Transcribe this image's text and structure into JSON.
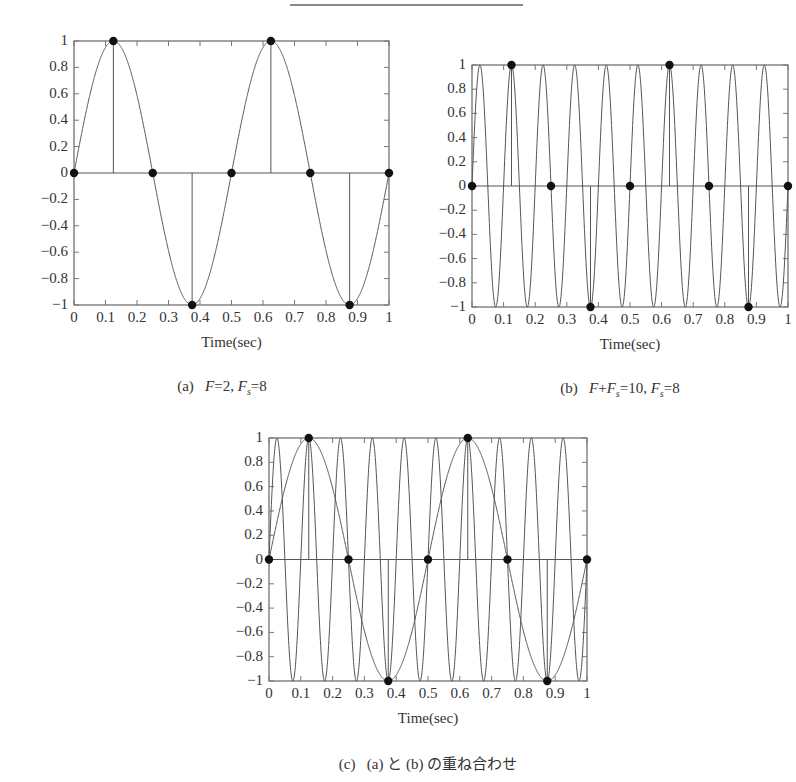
{
  "header": {
    "rule": true
  },
  "chart_data": [
    {
      "id": "a",
      "type": "line",
      "title": "",
      "caption_prefix": "(a)",
      "caption": "F=2, Fs=8",
      "caption_parts": [
        {
          "t": "F",
          "i": true
        },
        {
          "t": "=2, "
        },
        {
          "t": "F",
          "i": true
        },
        {
          "t": "s",
          "sub": true
        },
        {
          "t": "=8"
        }
      ],
      "xlabel": "Time(sec)",
      "ylabel": "",
      "xlim": [
        0,
        1
      ],
      "ylim": [
        -1,
        1
      ],
      "xticks": [
        "0",
        "0.1",
        "0.2",
        "0.3",
        "0.4",
        "0.5",
        "0.6",
        "0.7",
        "0.8",
        "0.9",
        "1"
      ],
      "yticks": [
        "1",
        "0.8",
        "0.6",
        "0.4",
        "0.2",
        "0",
        "−0.2",
        "−0.4",
        "−0.6",
        "−0.8",
        "−1"
      ],
      "grid": false,
      "series": [
        {
          "name": "sin(2π·2t)",
          "kind": "continuous",
          "frequency": 2
        }
      ],
      "samples": {
        "name": "samples Fs=8",
        "t": [
          0,
          0.125,
          0.25,
          0.375,
          0.5,
          0.625,
          0.75,
          0.875,
          1.0
        ],
        "values": [
          0,
          1,
          0,
          -1,
          0,
          1,
          0,
          -1,
          0
        ]
      },
      "box": {
        "left": 74,
        "top": 41,
        "right": 389,
        "bottom": 305
      }
    },
    {
      "id": "b",
      "type": "line",
      "title": "",
      "caption_prefix": "(b)",
      "caption": "F+Fs=10, Fs=8",
      "caption_parts": [
        {
          "t": "F",
          "i": true
        },
        {
          "t": "+"
        },
        {
          "t": "F",
          "i": true
        },
        {
          "t": "s",
          "sub": true
        },
        {
          "t": "=10, "
        },
        {
          "t": "F",
          "i": true
        },
        {
          "t": "s",
          "sub": true
        },
        {
          "t": "=8"
        }
      ],
      "xlabel": "Time(sec)",
      "ylabel": "",
      "xlim": [
        0,
        1
      ],
      "ylim": [
        -1,
        1
      ],
      "xticks": [
        "0",
        "0.1",
        "0.2",
        "0.3",
        "0.4",
        "0.5",
        "0.6",
        "0.7",
        "0.8",
        "0.9",
        "1"
      ],
      "yticks": [
        "1",
        "0.8",
        "0.6",
        "0.4",
        "0.2",
        "0",
        "−0.2",
        "−0.4",
        "−0.6",
        "−0.8",
        "−1"
      ],
      "grid": false,
      "series": [
        {
          "name": "sin(2π·10t)",
          "kind": "continuous",
          "frequency": 10
        }
      ],
      "samples": {
        "name": "samples Fs=8",
        "t": [
          0,
          0.125,
          0.25,
          0.375,
          0.5,
          0.625,
          0.75,
          0.875,
          1.0
        ],
        "values": [
          0,
          1,
          0,
          -1,
          0,
          1,
          0,
          -1,
          0
        ]
      },
      "box": {
        "left": 472,
        "top": 65,
        "right": 788,
        "bottom": 307
      }
    },
    {
      "id": "c",
      "type": "line",
      "title": "",
      "caption_prefix": "(c)",
      "caption": "(a) と (b) の重ね合わせ",
      "caption_parts": [
        {
          "t": "(a) と (b) の重ね合わせ"
        }
      ],
      "xlabel": "Time(sec)",
      "ylabel": "",
      "xlim": [
        0,
        1
      ],
      "ylim": [
        -1,
        1
      ],
      "xticks": [
        "0",
        "0.1",
        "0.2",
        "0.3",
        "0.4",
        "0.5",
        "0.6",
        "0.7",
        "0.8",
        "0.9",
        "1"
      ],
      "yticks": [
        "1",
        "0.8",
        "0.6",
        "0.4",
        "0.2",
        "0",
        "−0.2",
        "−0.4",
        "−0.6",
        "−0.8",
        "−1"
      ],
      "grid": false,
      "series": [
        {
          "name": "sin(2π·2t)",
          "kind": "continuous",
          "frequency": 2
        },
        {
          "name": "sin(2π·10t)",
          "kind": "continuous",
          "frequency": 10
        }
      ],
      "samples": {
        "name": "samples Fs=8",
        "t": [
          0,
          0.125,
          0.25,
          0.375,
          0.5,
          0.625,
          0.75,
          0.875,
          1.0
        ],
        "values": [
          0,
          1,
          0,
          -1,
          0,
          1,
          0,
          -1,
          0
        ]
      },
      "box": {
        "left": 269,
        "top": 438,
        "right": 587,
        "bottom": 681
      }
    }
  ]
}
